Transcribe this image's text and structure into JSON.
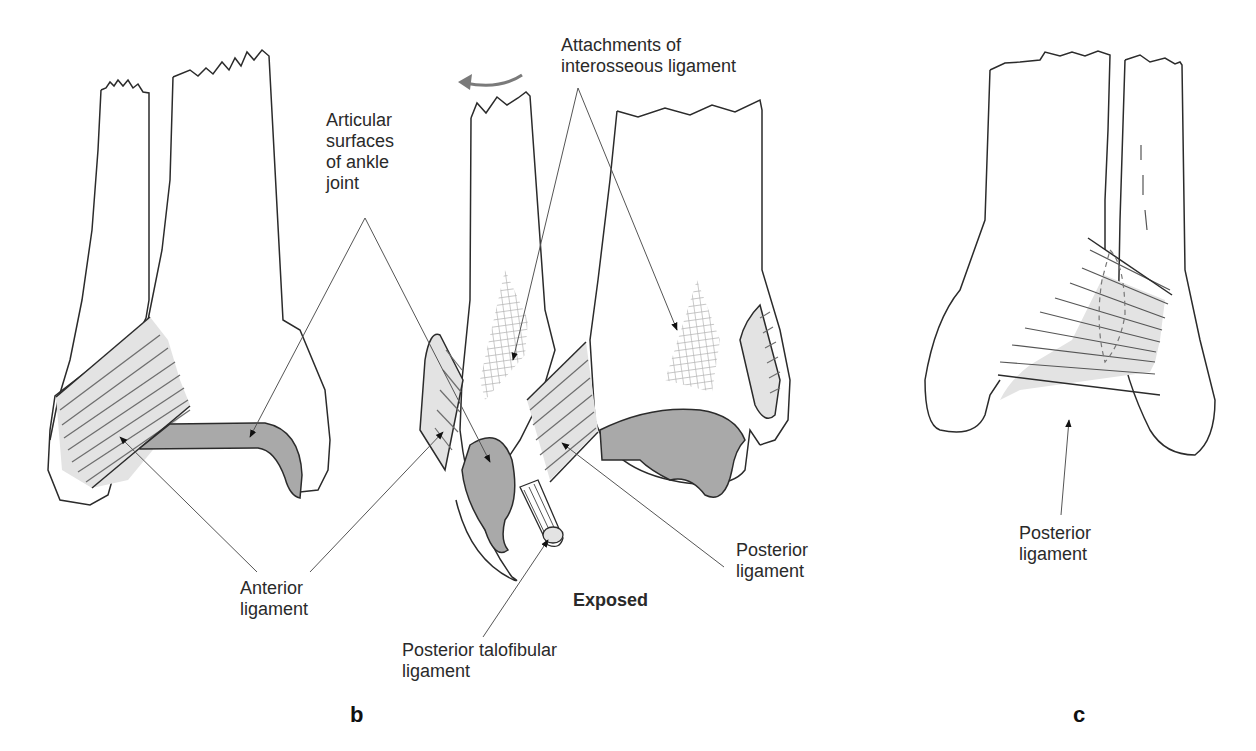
{
  "figure": {
    "panels": [
      {
        "id": "b",
        "label": "b"
      },
      {
        "id": "c",
        "label": "c"
      }
    ]
  },
  "labels": {
    "articular_surfaces": "Articular\nsurfaces\nof ankle\njoint",
    "interosseous_attachments": "Attachments of\ninterosseous ligament",
    "anterior_ligament": "Anterior\nligament",
    "posterior_ligament_b": "Posterior\nligament",
    "exposed": "Exposed",
    "posterior_talofibular": "Posterior talofibular\nligament",
    "posterior_ligament_c": "Posterior\nligament"
  },
  "colors": {
    "outline": "#2b2b2b",
    "leader_line": "#555555",
    "articular_fill": "#a9a9a9",
    "ligament_fill": "#e3e3e3",
    "hatch_line": "#6e6e6e",
    "mesh": "#b5b5b5",
    "rotation_arrow": "#7a7a7a"
  },
  "icons": {
    "rotation_arrow": "curved-left-arrow"
  }
}
